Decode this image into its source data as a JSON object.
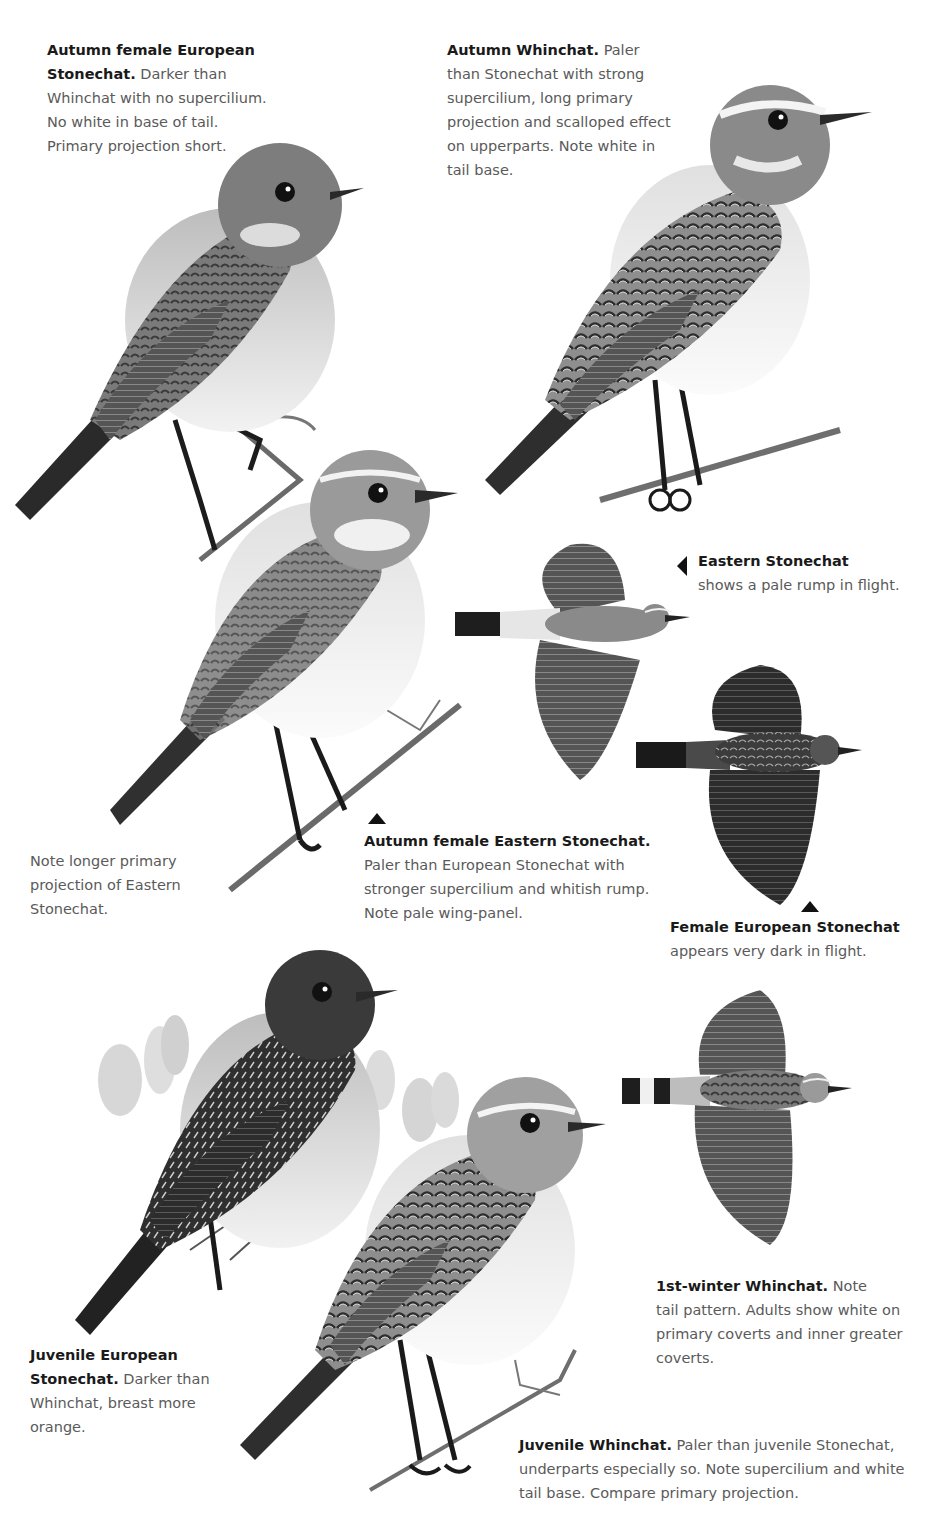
{
  "captions": [
    {
      "id": "autumn-female-european-stonechat",
      "title": "Autumn female European Stonechat.",
      "body": "Darker than Whinchat with no supercilium. No white in base of tail. Primary projection short.",
      "lines": [
        "Autumn female European",
        "Stonechat.",
        " Darker than",
        "Whinchat with no supercilium.",
        "No white in base of tail.",
        "Primary projection short."
      ]
    },
    {
      "id": "autumn-whinchat",
      "title": "Autumn Whinchat.",
      "body": "Paler than Stonechat with strong supercilium, long primary projection and scalloped effect on upperparts. Note white in tail base.",
      "lines": [
        "Autumn Whinchat.",
        " Paler",
        "than Stonechat with strong",
        "supercilium, long primary",
        "projection and scalloped effect",
        "on upperparts. Note white in",
        "tail base."
      ]
    },
    {
      "id": "eastern-stonechat-flight",
      "title": "Eastern Stonechat",
      "body": "shows a pale rump in flight."
    },
    {
      "id": "autumn-female-eastern-stonechat",
      "title": "Autumn female Eastern Stonechat.",
      "lines": [
        "Paler than European Stonechat with",
        "stronger supercilium and whitish rump.",
        "Note pale wing-panel."
      ]
    },
    {
      "id": "note-primary-projection",
      "lines": [
        "Note longer primary",
        "projection of Eastern",
        "Stonechat."
      ]
    },
    {
      "id": "female-european-stonechat-flight",
      "title": "Female European Stonechat",
      "body": "appears very dark in flight."
    },
    {
      "id": "first-winter-whinchat",
      "title": "1st-winter Whinchat.",
      "lines": [
        " Note",
        "tail pattern. Adults show white on",
        "primary coverts and inner greater",
        "coverts."
      ]
    },
    {
      "id": "juvenile-european-stonechat",
      "title1": "Juvenile European",
      "title2": "Stonechat.",
      "lines": [
        " Darker than",
        "Whinchat, breast more",
        "orange."
      ]
    },
    {
      "id": "juvenile-whinchat",
      "title": "Juvenile Whinchat.",
      "lines": [
        " Paler than juvenile Stonechat,",
        "underparts especially so. Note supercilium and white",
        "tail base. Compare primary projection."
      ]
    }
  ],
  "illustrations": [
    {
      "name": "autumn-female-european-stonechat-perched",
      "tone": "#6b6b6b"
    },
    {
      "name": "autumn-whinchat-perched",
      "tone": "#7a7a7a"
    },
    {
      "name": "autumn-female-eastern-stonechat-perched",
      "tone": "#8a8a8a"
    },
    {
      "name": "eastern-stonechat-in-flight",
      "tone": "#777777"
    },
    {
      "name": "female-european-stonechat-in-flight",
      "tone": "#3f3f3f"
    },
    {
      "name": "juvenile-european-stonechat-perched",
      "tone": "#4a4a4a"
    },
    {
      "name": "juvenile-whinchat-perched",
      "tone": "#8c8c8c"
    },
    {
      "name": "first-winter-whinchat-in-flight",
      "tone": "#6a6a6a"
    }
  ]
}
